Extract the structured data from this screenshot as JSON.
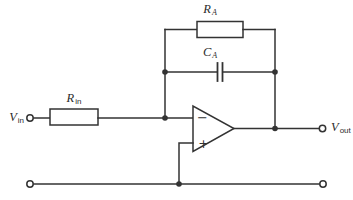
{
  "labels": {
    "v_in": {
      "main": "V",
      "sub": "in"
    },
    "r_in": {
      "main": "R",
      "sub": "in"
    },
    "r_a": {
      "main": "R",
      "sub": "A"
    },
    "c_a": {
      "main": "C",
      "sub": "A"
    },
    "v_out": {
      "main": "V",
      "sub": "out"
    }
  },
  "opamp": {
    "inverting_label": "−",
    "noninverting_label": "+"
  },
  "colors": {
    "line": "#333333",
    "background": "#ffffff"
  }
}
